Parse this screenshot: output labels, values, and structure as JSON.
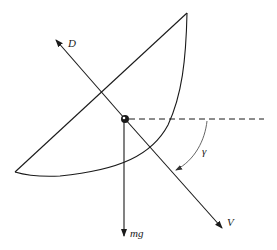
{
  "diagram": {
    "type": "free-body diagram",
    "labels": {
      "drag": "D",
      "weight": "mg",
      "velocity": "V",
      "angle": "γ"
    },
    "colors": {
      "stroke": "#1a1a1a",
      "background": "#ffffff",
      "arc": "#555555"
    },
    "elements": [
      {
        "name": "sail-outline",
        "kind": "curved triangle"
      },
      {
        "name": "center-of-mass",
        "kind": "filled dot"
      },
      {
        "name": "drag-vector",
        "label": "D",
        "direction": "up-left"
      },
      {
        "name": "weight-vector",
        "label": "mg",
        "direction": "down"
      },
      {
        "name": "velocity-vector",
        "label": "V",
        "direction": "down-right"
      },
      {
        "name": "horizontal-reference",
        "kind": "dashed line"
      },
      {
        "name": "flight-path-angle",
        "label": "γ",
        "kind": "arc arrow from horizontal to V"
      }
    ]
  }
}
